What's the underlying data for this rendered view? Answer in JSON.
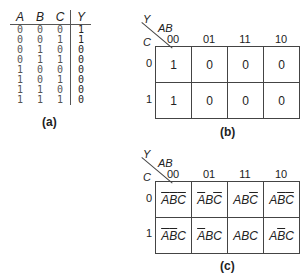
{
  "truth_table": {
    "headers": [
      "A",
      "B",
      "C",
      "Y"
    ],
    "rows": [
      [
        "0",
        "0",
        "0",
        "1"
      ],
      [
        "0",
        "0",
        "1",
        "1"
      ],
      [
        "0",
        "1",
        "0",
        "0"
      ],
      [
        "0",
        "1",
        "1",
        "0"
      ],
      [
        "1",
        "0",
        "0",
        "0"
      ],
      [
        "1",
        "0",
        "1",
        "0"
      ],
      [
        "1",
        "1",
        "0",
        "0"
      ],
      [
        "1",
        "1",
        "1",
        "0"
      ]
    ],
    "caption": "(a)"
  },
  "kmap_b": {
    "output_label": "Y",
    "col_var": "AB",
    "row_var": "C",
    "col_headers": [
      "00",
      "01",
      "11",
      "10"
    ],
    "row_headers": [
      "0",
      "1"
    ],
    "cells": [
      [
        "1",
        "0",
        "0",
        "0"
      ],
      [
        "1",
        "0",
        "0",
        "0"
      ]
    ],
    "caption": "(b)"
  },
  "kmap_c": {
    "output_label": "Y",
    "col_var": "AB",
    "row_var": "C",
    "col_headers": [
      "00",
      "01",
      "11",
      "10"
    ],
    "row_headers": [
      "0",
      "1"
    ],
    "cells": [
      [
        "A'B'C'",
        "A'BC'",
        "ABC'",
        "AB'C'"
      ],
      [
        "A'B'C",
        "A'BC",
        "ABC",
        "AB'C"
      ]
    ],
    "caption": "(c)"
  }
}
